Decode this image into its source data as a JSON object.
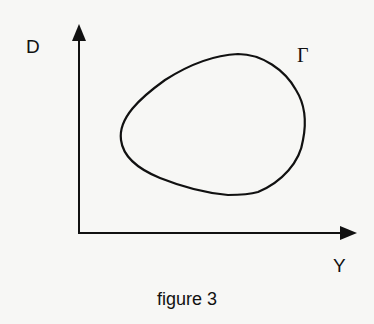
{
  "figure": {
    "caption": "figure 3",
    "vertical_axis_label": "D",
    "horizontal_axis_label": "Y",
    "curve_label": "Γ",
    "curve_description": "closed curve",
    "colors": {
      "ink": "#111111",
      "paper": "#f7f7f5"
    }
  }
}
